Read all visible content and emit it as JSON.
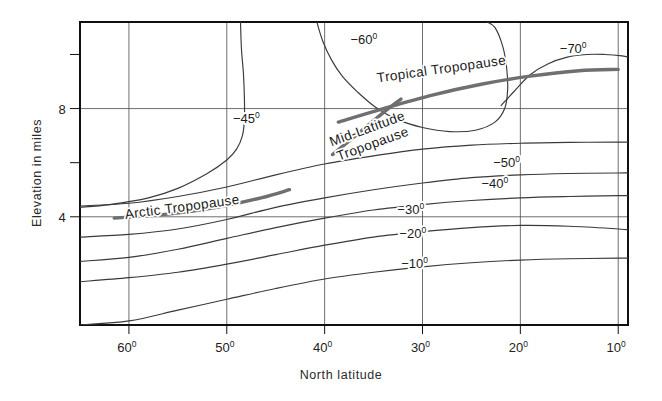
{
  "chart_data": {
    "type": "line",
    "title": "",
    "subtitle": "",
    "xlabel": "North latitude",
    "ylabel": "Elevation in miles",
    "xlim": [
      65,
      9
    ],
    "ylim": [
      0,
      11.2
    ],
    "x_tick_labels": [
      "60",
      "50",
      "40",
      "30",
      "20",
      "10"
    ],
    "x_tick_degree_mark": "0",
    "x_tick_values": [
      60,
      50,
      40,
      30,
      20,
      10
    ],
    "y_tick_labels": [
      "8",
      "4"
    ],
    "y_tick_values": [
      8,
      4
    ],
    "y_minor_tick_values": [
      10,
      6
    ],
    "grid": true,
    "grid_orientation": "both",
    "legend": "none",
    "axis_note_degree_superscript": true,
    "series": [
      {
        "name": "-10 degree isotherm",
        "label": "−10",
        "label_degree": "0",
        "label_x": 30.8,
        "label_y": 2.1,
        "points": [
          [
            65,
            0.0
          ],
          [
            60,
            0.15
          ],
          [
            55,
            0.55
          ],
          [
            50,
            0.95
          ],
          [
            45,
            1.35
          ],
          [
            40,
            1.7
          ],
          [
            35,
            1.95
          ],
          [
            30,
            2.15
          ],
          [
            25,
            2.3
          ],
          [
            20,
            2.4
          ],
          [
            15,
            2.45
          ],
          [
            10,
            2.47
          ],
          [
            9,
            2.47
          ]
        ]
      },
      {
        "name": "-20 degree isotherm",
        "label": "−20",
        "label_degree": "0",
        "label_x": 31.0,
        "label_y": 3.2,
        "points": [
          [
            65,
            1.6
          ],
          [
            60,
            1.75
          ],
          [
            55,
            1.95
          ],
          [
            50,
            2.25
          ],
          [
            45,
            2.6
          ],
          [
            40,
            2.95
          ],
          [
            35,
            3.25
          ],
          [
            30,
            3.45
          ],
          [
            25,
            3.6
          ],
          [
            20,
            3.68
          ],
          [
            15,
            3.65
          ],
          [
            10,
            3.55
          ],
          [
            9,
            3.52
          ]
        ]
      },
      {
        "name": "-30 degree isotherm",
        "label": "−30",
        "label_degree": "0",
        "label_x": 31.2,
        "label_y": 4.1,
        "points": [
          [
            65,
            2.35
          ],
          [
            60,
            2.5
          ],
          [
            55,
            2.8
          ],
          [
            50,
            3.2
          ],
          [
            45,
            3.6
          ],
          [
            40,
            3.95
          ],
          [
            35,
            4.25
          ],
          [
            30,
            4.45
          ],
          [
            25,
            4.6
          ],
          [
            20,
            4.7
          ],
          [
            15,
            4.75
          ],
          [
            10,
            4.78
          ],
          [
            9,
            4.78
          ]
        ]
      },
      {
        "name": "-40 degree isotherm",
        "label": "−40",
        "label_degree": "0",
        "label_x": 22.6,
        "label_y": 5.05,
        "points": [
          [
            65,
            3.25
          ],
          [
            60,
            3.35
          ],
          [
            55,
            3.55
          ],
          [
            50,
            3.9
          ],
          [
            45,
            4.35
          ],
          [
            40,
            4.7
          ],
          [
            35,
            5.0
          ],
          [
            30,
            5.25
          ],
          [
            25,
            5.45
          ],
          [
            20,
            5.55
          ],
          [
            15,
            5.6
          ],
          [
            10,
            5.62
          ],
          [
            9,
            5.62
          ]
        ]
      },
      {
        "name": "-45 degree isotherm (arctic branch)",
        "label": "−45",
        "label_degree": "0",
        "label_x": 48.0,
        "label_y": 7.45,
        "points": [
          [
            65,
            4.35
          ],
          [
            62,
            4.45
          ],
          [
            58,
            4.7
          ],
          [
            55,
            5.05
          ],
          [
            52,
            5.6
          ],
          [
            50,
            6.1
          ],
          [
            49,
            6.5
          ],
          [
            48.4,
            7.0
          ],
          [
            48.2,
            7.6
          ],
          [
            48.2,
            8.4
          ],
          [
            48.3,
            9.3
          ],
          [
            48.5,
            10.2
          ],
          [
            48.6,
            11.2
          ]
        ]
      },
      {
        "name": "-50 degree isotherm",
        "label": "−50",
        "label_degree": "0",
        "label_x": 21.4,
        "label_y": 5.85,
        "points": [
          [
            65,
            4.4
          ],
          [
            60,
            4.5
          ],
          [
            55,
            4.75
          ],
          [
            50,
            5.1
          ],
          [
            45,
            5.55
          ],
          [
            40,
            5.95
          ],
          [
            35,
            6.25
          ],
          [
            30,
            6.5
          ],
          [
            25,
            6.65
          ],
          [
            20,
            6.72
          ],
          [
            15,
            6.75
          ],
          [
            10,
            6.76
          ],
          [
            9,
            6.76
          ]
        ]
      },
      {
        "name": "-60 degree isotherm (tropical cell)",
        "label": "−60",
        "label_degree": "0",
        "label_x": 36.0,
        "label_y": 10.4,
        "points": [
          [
            40.8,
            11.2
          ],
          [
            40.2,
            10.5
          ],
          [
            39.3,
            9.8
          ],
          [
            38.2,
            9.2
          ],
          [
            36.6,
            8.6
          ],
          [
            34.8,
            8.05
          ],
          [
            32.6,
            7.6
          ],
          [
            30.0,
            7.3
          ],
          [
            27.2,
            7.15
          ],
          [
            24.6,
            7.2
          ],
          [
            22.6,
            7.5
          ],
          [
            21.6,
            8.0
          ],
          [
            21.3,
            8.7
          ],
          [
            21.4,
            9.5
          ],
          [
            21.8,
            10.3
          ],
          [
            22.6,
            11.0
          ],
          [
            23.4,
            11.2
          ]
        ]
      },
      {
        "name": "-70 degree isotherm (tropical top cell)",
        "label": "−70",
        "label_degree": "0",
        "label_x": 14.6,
        "label_y": 10.05,
        "points": [
          [
            22.0,
            8.1
          ],
          [
            20.6,
            8.65
          ],
          [
            19.0,
            9.25
          ],
          [
            17.2,
            9.65
          ],
          [
            15.2,
            9.9
          ],
          [
            13.2,
            10.0
          ],
          [
            11.4,
            10.0
          ],
          [
            9.6,
            9.95
          ],
          [
            9.0,
            9.9
          ]
        ]
      }
    ],
    "features": [
      {
        "name": "arctic-tropopause",
        "label": "Arctic  Tropopause",
        "x": 54.5,
        "y": 4.2,
        "rotation": -7.5,
        "style": "thick-grey",
        "points": [
          [
            61.5,
            3.95
          ],
          [
            56,
            4.1
          ],
          [
            51,
            4.35
          ],
          [
            46.5,
            4.7
          ],
          [
            43.6,
            5.0
          ]
        ]
      },
      {
        "name": "mid-latitude-tropopause",
        "label": "Mid-Latitude\nTropopause",
        "line1": "Mid-Latitude",
        "line2": "Tropopause",
        "x": 35.5,
        "y": 7.1,
        "rotation": -20,
        "style": "thick-grey",
        "points": [
          [
            39.2,
            6.3
          ],
          [
            36.5,
            7.1
          ],
          [
            34.0,
            7.85
          ],
          [
            32.2,
            8.35
          ]
        ]
      },
      {
        "name": "tropical-tropopause",
        "label": "Tropical  Tropopause",
        "x": 28.0,
        "y": 9.3,
        "rotation": -8,
        "style": "thick-grey",
        "points": [
          [
            38.6,
            7.5
          ],
          [
            34,
            8.0
          ],
          [
            29,
            8.5
          ],
          [
            24,
            8.9
          ],
          [
            19,
            9.2
          ],
          [
            14,
            9.4
          ],
          [
            10.0,
            9.45
          ]
        ]
      }
    ],
    "colors": {
      "contour": "#3a3a3a",
      "frame": "#111111",
      "grid": "#4a4a4a",
      "feature": "#6f6f6f",
      "text": "#1b1b1b",
      "background": "#ffffff"
    }
  }
}
